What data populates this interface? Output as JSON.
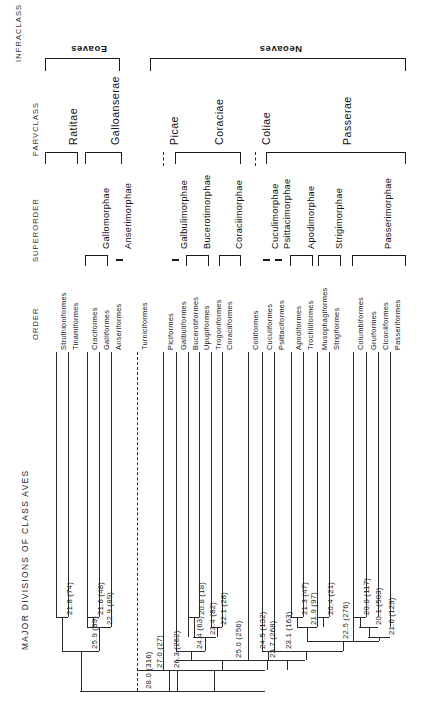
{
  "figure": {
    "title": "MAJOR DIVISIONS OF CLASS AVES",
    "column_headers": [
      "INFRACLASS",
      "PARVCLASS",
      "SUPERORDER",
      "ORDER"
    ]
  },
  "infraclass": [
    {
      "name": "Eoaves",
      "x1": 45,
      "x2": 120
    },
    {
      "name": "Neoaves",
      "x1": 150,
      "x2": 406
    }
  ],
  "parvclass": [
    {
      "name": "Ratitae",
      "x1": 45,
      "x2": 78,
      "dashed": false
    },
    {
      "name": "Galloanserae",
      "x1": 85,
      "x2": 122,
      "dashed": false
    },
    {
      "name": "Picae",
      "x1": 163,
      "x2": 163,
      "dashed": true
    },
    {
      "name": "Coraciae",
      "x1": 175,
      "x2": 241,
      "dashed": false
    },
    {
      "name": "Coliae",
      "x1": 255,
      "x2": 255,
      "dashed": true
    },
    {
      "name": "Passerae",
      "x1": 266,
      "x2": 406,
      "dashed": false
    }
  ],
  "superorder": [
    {
      "name": "Gallomorphae",
      "x1": 85,
      "x2": 108,
      "dashed": false
    },
    {
      "name": "Anserimorphae",
      "x1": 119,
      "x2": 119,
      "dashed": true
    },
    {
      "name": "Galbulimorphae",
      "x1": 175,
      "x2": 175,
      "dashed": true
    },
    {
      "name": "Bucerotimorphae",
      "x1": 186,
      "x2": 209,
      "dashed": false
    },
    {
      "name": "Coraciimorphae",
      "x1": 219,
      "x2": 241,
      "dashed": false
    },
    {
      "name": "Cuculimorphae",
      "x1": 266,
      "x2": 266,
      "dashed": true
    },
    {
      "name": "Psittacimorphae",
      "x1": 278,
      "x2": 278,
      "dashed": true
    },
    {
      "name": "Apodimorphae",
      "x1": 290,
      "x2": 313,
      "dashed": false
    },
    {
      "name": "Strigimorphae",
      "x1": 318,
      "x2": 341,
      "dashed": false
    },
    {
      "name": "Passerimorphae",
      "x1": 352,
      "x2": 406,
      "dashed": false
    }
  ],
  "orders": [
    {
      "name": "Struthioniformes",
      "x": 56,
      "dashed": false
    },
    {
      "name": "Tinamiformes",
      "x": 68,
      "dashed": false
    },
    {
      "name": "Craciformes",
      "x": 87,
      "dashed": false
    },
    {
      "name": "Galliformes",
      "x": 99,
      "dashed": false
    },
    {
      "name": "Anseriformes",
      "x": 111,
      "dashed": false
    },
    {
      "name": "Turniciformes",
      "x": 137,
      "dashed": true
    },
    {
      "name": "Piciformes",
      "x": 163,
      "dashed": false
    },
    {
      "name": "Galbuliformes",
      "x": 176,
      "dashed": false
    },
    {
      "name": "Bucerotiformes",
      "x": 188,
      "dashed": false
    },
    {
      "name": "Upupiformes",
      "x": 199,
      "dashed": false
    },
    {
      "name": "Trogoniformes",
      "x": 211,
      "dashed": false
    },
    {
      "name": "Coraciiformes",
      "x": 222,
      "dashed": false
    },
    {
      "name": "Coliiformes",
      "x": 248,
      "dashed": false
    },
    {
      "name": "Cuculiformes",
      "x": 262,
      "dashed": false
    },
    {
      "name": "Psittaciformes",
      "x": 274,
      "dashed": false
    },
    {
      "name": "Apodiformes",
      "x": 291,
      "dashed": false
    },
    {
      "name": "Trochiliformes",
      "x": 303,
      "dashed": false
    },
    {
      "name": "Musophagiformes",
      "x": 317,
      "dashed": false
    },
    {
      "name": "Strigiformes",
      "x": 329,
      "dashed": false
    },
    {
      "name": "Columbiformes",
      "x": 353,
      "dashed": false
    },
    {
      "name": "Gruiformes",
      "x": 366,
      "dashed": false
    },
    {
      "name": "Ciconiiformes",
      "x": 378,
      "dashed": false
    },
    {
      "name": "Passeriformes",
      "x": 390,
      "dashed": false
    }
  ],
  "nodes": [
    {
      "label": "21.8 (74)",
      "x": 62,
      "y": 617
    },
    {
      "label": "25.9 (99)",
      "x": 87,
      "y": 651
    },
    {
      "label": "21.6 (48)",
      "x": 93,
      "y": 617
    },
    {
      "label": "22.9 (89)",
      "x": 102,
      "y": 627
    },
    {
      "label": "28.0 (316)",
      "x": 141,
      "y": 691
    },
    {
      "label": "27.0 (27)",
      "x": 152,
      "y": 670
    },
    {
      "label": "26.3 (262)",
      "x": 169,
      "y": 670
    },
    {
      "label": "24.4 (63)",
      "x": 192,
      "y": 651
    },
    {
      "label": "20.8 (18)",
      "x": 194,
      "y": 617
    },
    {
      "label": "23.4 (82)",
      "x": 205,
      "y": 637
    },
    {
      "label": "22.1 (28)",
      "x": 216,
      "y": 627
    },
    {
      "label": "25.0 (256)",
      "x": 231,
      "y": 660
    },
    {
      "label": "24.5 (132)",
      "x": 255,
      "y": 651
    },
    {
      "label": "23.7 (268)",
      "x": 265,
      "y": 660
    },
    {
      "label": "23.1 (163)",
      "x": 281,
      "y": 651
    },
    {
      "label": "21.3 (47)",
      "x": 297,
      "y": 617
    },
    {
      "label": "21.9 (97)",
      "x": 306,
      "y": 627
    },
    {
      "label": "20.4 (21)",
      "x": 323,
      "y": 617
    },
    {
      "label": "22.5 (276)",
      "x": 338,
      "y": 641
    },
    {
      "label": "20.8 (117)",
      "x": 359,
      "y": 617
    },
    {
      "label": "20.1 (503)",
      "x": 371,
      "y": 627
    },
    {
      "label": "21.6 (129)",
      "x": 384,
      "y": 637
    }
  ],
  "chart_data": {
    "type": "tree",
    "title": "MAJOR DIVISIONS OF CLASS AVES",
    "ranks": [
      "INFRACLASS",
      "PARVCLASS",
      "SUPERORDER",
      "ORDER"
    ],
    "taxa": [
      {
        "infraclass": "Eoaves",
        "parvclass": "Ratitae",
        "superorder": "",
        "order": "Struthioniformes"
      },
      {
        "infraclass": "Eoaves",
        "parvclass": "Ratitae",
        "superorder": "",
        "order": "Tinamiformes"
      },
      {
        "infraclass": "Eoaves",
        "parvclass": "Galloanserae",
        "superorder": "Gallomorphae",
        "order": "Craciformes"
      },
      {
        "infraclass": "Eoaves",
        "parvclass": "Galloanserae",
        "superorder": "Gallomorphae",
        "order": "Galliformes"
      },
      {
        "infraclass": "Eoaves",
        "parvclass": "Galloanserae",
        "superorder": "Anserimorphae",
        "order": "Anseriformes"
      },
      {
        "infraclass": "Neoaves",
        "parvclass": "",
        "superorder": "",
        "order": "Turniciformes"
      },
      {
        "infraclass": "Neoaves",
        "parvclass": "Picae",
        "superorder": "",
        "order": "Piciformes"
      },
      {
        "infraclass": "Neoaves",
        "parvclass": "Coraciae",
        "superorder": "Galbulimorphae",
        "order": "Galbuliformes"
      },
      {
        "infraclass": "Neoaves",
        "parvclass": "Coraciae",
        "superorder": "Bucerotimorphae",
        "order": "Bucerotiformes"
      },
      {
        "infraclass": "Neoaves",
        "parvclass": "Coraciae",
        "superorder": "Bucerotimorphae",
        "order": "Upupiformes"
      },
      {
        "infraclass": "Neoaves",
        "parvclass": "Coraciae",
        "superorder": "Coraciimorphae",
        "order": "Trogoniformes"
      },
      {
        "infraclass": "Neoaves",
        "parvclass": "Coraciae",
        "superorder": "Coraciimorphae",
        "order": "Coraciiformes"
      },
      {
        "infraclass": "Neoaves",
        "parvclass": "Coliae",
        "superorder": "",
        "order": "Coliiformes"
      },
      {
        "infraclass": "Neoaves",
        "parvclass": "Passerae",
        "superorder": "Cuculimorphae",
        "order": "Cuculiformes"
      },
      {
        "infraclass": "Neoaves",
        "parvclass": "Passerae",
        "superorder": "Psittacimorphae",
        "order": "Psittaciformes"
      },
      {
        "infraclass": "Neoaves",
        "parvclass": "Passerae",
        "superorder": "Apodimorphae",
        "order": "Apodiformes"
      },
      {
        "infraclass": "Neoaves",
        "parvclass": "Passerae",
        "superorder": "Apodimorphae",
        "order": "Trochiliformes"
      },
      {
        "infraclass": "Neoaves",
        "parvclass": "Passerae",
        "superorder": "Strigimorphae",
        "order": "Musophagiformes"
      },
      {
        "infraclass": "Neoaves",
        "parvclass": "Passerae",
        "superorder": "Strigimorphae",
        "order": "Strigiformes"
      },
      {
        "infraclass": "Neoaves",
        "parvclass": "Passerae",
        "superorder": "Passerimorphae",
        "order": "Columbiformes"
      },
      {
        "infraclass": "Neoaves",
        "parvclass": "Passerae",
        "superorder": "Passerimorphae",
        "order": "Gruiformes"
      },
      {
        "infraclass": "Neoaves",
        "parvclass": "Passerae",
        "superorder": "Passerimorphae",
        "order": "Ciconiiformes"
      },
      {
        "infraclass": "Neoaves",
        "parvclass": "Passerae",
        "superorder": "Passerimorphae",
        "order": "Passeriformes"
      }
    ],
    "node_values": [
      {
        "label": "21.8 (74)",
        "distance": 21.8,
        "taxa_count": 74
      },
      {
        "label": "25.9 (99)",
        "distance": 25.9,
        "taxa_count": 99
      },
      {
        "label": "21.6 (48)",
        "distance": 21.6,
        "taxa_count": 48
      },
      {
        "label": "22.9 (89)",
        "distance": 22.9,
        "taxa_count": 89
      },
      {
        "label": "28.0 (316)",
        "distance": 28.0,
        "taxa_count": 316
      },
      {
        "label": "27.0 (27)",
        "distance": 27.0,
        "taxa_count": 27
      },
      {
        "label": "26.3 (262)",
        "distance": 26.3,
        "taxa_count": 262
      },
      {
        "label": "24.4 (63)",
        "distance": 24.4,
        "taxa_count": 63
      },
      {
        "label": "20.8 (18)",
        "distance": 20.8,
        "taxa_count": 18
      },
      {
        "label": "23.4 (82)",
        "distance": 23.4,
        "taxa_count": 82
      },
      {
        "label": "22.1 (28)",
        "distance": 22.1,
        "taxa_count": 28
      },
      {
        "label": "25.0 (256)",
        "distance": 25.0,
        "taxa_count": 256
      },
      {
        "label": "24.5 (132)",
        "distance": 24.5,
        "taxa_count": 132
      },
      {
        "label": "23.7 (268)",
        "distance": 23.7,
        "taxa_count": 268
      },
      {
        "label": "23.1 (163)",
        "distance": 23.1,
        "taxa_count": 163
      },
      {
        "label": "21.3 (47)",
        "distance": 21.3,
        "taxa_count": 47
      },
      {
        "label": "21.9 (97)",
        "distance": 21.9,
        "taxa_count": 97
      },
      {
        "label": "20.4 (21)",
        "distance": 20.4,
        "taxa_count": 21
      },
      {
        "label": "22.5 (276)",
        "distance": 22.5,
        "taxa_count": 276
      },
      {
        "label": "20.8 (117)",
        "distance": 20.8,
        "taxa_count": 117
      },
      {
        "label": "20.1 (503)",
        "distance": 20.1,
        "taxa_count": 503
      },
      {
        "label": "21.6 (129)",
        "distance": 21.6,
        "taxa_count": 129
      }
    ]
  }
}
